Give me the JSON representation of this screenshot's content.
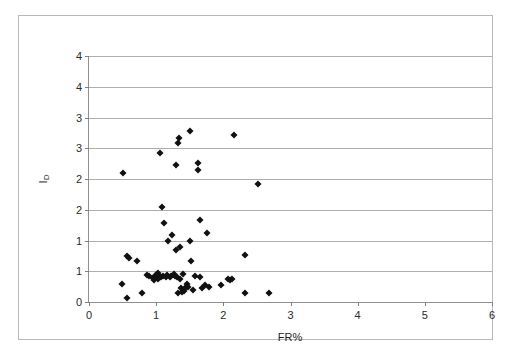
{
  "chart_data": {
    "type": "scatter",
    "title": "",
    "xlabel": "FR%",
    "ylabel": "ID",
    "ylabel_main": "I",
    "ylabel_sub": "D",
    "xlim": [
      0,
      6
    ],
    "ylim": [
      0,
      4
    ],
    "grid": "horizontal",
    "legend": "none",
    "marker": "filled-diamond",
    "marker_color": "#111111",
    "gridline_color": "#aeaeae",
    "axis_color": "#909090",
    "frame_color": "#b9b9b9",
    "background": "#ffffff",
    "xticks": [
      0,
      1,
      2,
      3,
      4,
      5,
      6
    ],
    "xtick_labels": [
      "0",
      "1",
      "2",
      "3",
      "4",
      "5",
      "6"
    ],
    "yticks": [
      0,
      0.5,
      1,
      1.5,
      2,
      2.5,
      3,
      3.5,
      4
    ],
    "ytick_labels": [
      "0",
      "1",
      "1",
      "2",
      "2",
      "3",
      "3",
      "4",
      "4"
    ],
    "points": [
      {
        "x": 0.49,
        "y": 0.3
      },
      {
        "x": 0.5,
        "y": 2.09
      },
      {
        "x": 0.56,
        "y": 0.07
      },
      {
        "x": 0.57,
        "y": 0.75
      },
      {
        "x": 0.6,
        "y": 0.72
      },
      {
        "x": 0.72,
        "y": 0.66
      },
      {
        "x": 0.79,
        "y": 0.15
      },
      {
        "x": 0.86,
        "y": 0.44
      },
      {
        "x": 0.9,
        "y": 0.42
      },
      {
        "x": 0.95,
        "y": 0.39
      },
      {
        "x": 0.97,
        "y": 0.36
      },
      {
        "x": 0.99,
        "y": 0.43
      },
      {
        "x": 1.0,
        "y": 0.41
      },
      {
        "x": 1.01,
        "y": 0.45
      },
      {
        "x": 1.02,
        "y": 0.38
      },
      {
        "x": 1.03,
        "y": 0.47
      },
      {
        "x": 1.04,
        "y": 0.42
      },
      {
        "x": 1.05,
        "y": 2.42
      },
      {
        "x": 1.07,
        "y": 0.4
      },
      {
        "x": 1.09,
        "y": 1.54
      },
      {
        "x": 1.1,
        "y": 0.43
      },
      {
        "x": 1.11,
        "y": 1.28
      },
      {
        "x": 1.14,
        "y": 0.41
      },
      {
        "x": 1.16,
        "y": 0.44
      },
      {
        "x": 1.18,
        "y": 1.0
      },
      {
        "x": 1.2,
        "y": 0.4
      },
      {
        "x": 1.22,
        "y": 0.42
      },
      {
        "x": 1.24,
        "y": 1.09
      },
      {
        "x": 1.26,
        "y": 0.45
      },
      {
        "x": 1.28,
        "y": 0.43
      },
      {
        "x": 1.29,
        "y": 0.84
      },
      {
        "x": 1.3,
        "y": 2.23
      },
      {
        "x": 1.31,
        "y": 0.41
      },
      {
        "x": 1.32,
        "y": 0.15
      },
      {
        "x": 1.33,
        "y": 2.58
      },
      {
        "x": 1.34,
        "y": 2.67
      },
      {
        "x": 1.35,
        "y": 0.38
      },
      {
        "x": 1.36,
        "y": 0.9
      },
      {
        "x": 1.37,
        "y": 0.22
      },
      {
        "x": 1.38,
        "y": 0.17
      },
      {
        "x": 1.4,
        "y": 0.45
      },
      {
        "x": 1.42,
        "y": 0.18
      },
      {
        "x": 1.44,
        "y": 0.25
      },
      {
        "x": 1.46,
        "y": 0.3
      },
      {
        "x": 1.48,
        "y": 0.24
      },
      {
        "x": 1.5,
        "y": 1.0
      },
      {
        "x": 1.51,
        "y": 2.78
      },
      {
        "x": 1.52,
        "y": 0.66
      },
      {
        "x": 1.55,
        "y": 0.2
      },
      {
        "x": 1.58,
        "y": 0.43
      },
      {
        "x": 1.62,
        "y": 2.14
      },
      {
        "x": 1.63,
        "y": 2.26
      },
      {
        "x": 1.65,
        "y": 0.41
      },
      {
        "x": 1.66,
        "y": 1.33
      },
      {
        "x": 1.68,
        "y": 0.22
      },
      {
        "x": 1.72,
        "y": 0.27
      },
      {
        "x": 1.75,
        "y": 1.12
      },
      {
        "x": 1.78,
        "y": 0.24
      },
      {
        "x": 1.96,
        "y": 0.27
      },
      {
        "x": 2.07,
        "y": 0.38
      },
      {
        "x": 2.1,
        "y": 0.36
      },
      {
        "x": 2.13,
        "y": 0.37
      },
      {
        "x": 2.16,
        "y": 2.71
      },
      {
        "x": 2.32,
        "y": 0.76
      },
      {
        "x": 2.33,
        "y": 0.15
      },
      {
        "x": 2.51,
        "y": 1.92
      },
      {
        "x": 2.68,
        "y": 0.14
      }
    ]
  }
}
